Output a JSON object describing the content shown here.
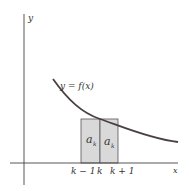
{
  "diagram": {
    "title": "",
    "axes": {
      "x_label": "x",
      "y_label": "y"
    },
    "curve": {
      "label": "y = f(x)",
      "color": "#4a4040"
    },
    "rectangles": [
      {
        "label": "a",
        "subscript": "k",
        "from": "k − 1",
        "to": "k"
      },
      {
        "label": "a",
        "subscript": "k",
        "from": "k",
        "to": "k + 1"
      }
    ],
    "tick_labels": {
      "k_minus_1": "k − 1",
      "k": "k",
      "k_plus_1": "k + 1"
    },
    "colors": {
      "axis": "#444444",
      "rect_fill": "#d9d9d9",
      "rect_stroke": "#555555",
      "curve": "#4a4040"
    }
  }
}
